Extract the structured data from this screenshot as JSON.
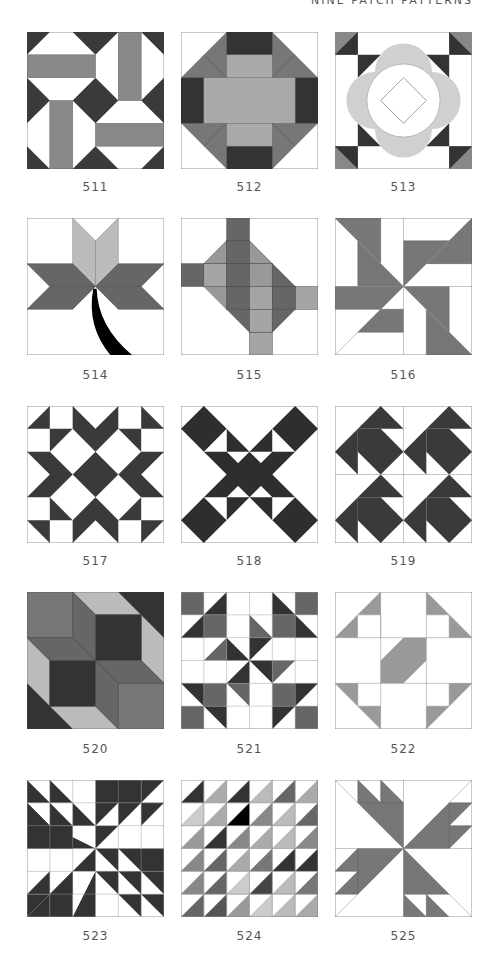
{
  "header": {
    "title": "NINE PATCH PATTERNS"
  },
  "colors": {
    "dark": "#3a3a3a",
    "mid": "#777777",
    "light": "#a9a9a9",
    "pale": "#cfcfcf",
    "line": "#888888",
    "black": "#000000"
  },
  "blocks": [
    {
      "number": "511"
    },
    {
      "number": "512"
    },
    {
      "number": "513"
    },
    {
      "number": "514"
    },
    {
      "number": "515"
    },
    {
      "number": "516"
    },
    {
      "number": "517"
    },
    {
      "number": "518"
    },
    {
      "number": "519"
    },
    {
      "number": "520"
    },
    {
      "number": "521"
    },
    {
      "number": "522"
    },
    {
      "number": "523"
    },
    {
      "number": "524"
    },
    {
      "number": "525"
    }
  ]
}
